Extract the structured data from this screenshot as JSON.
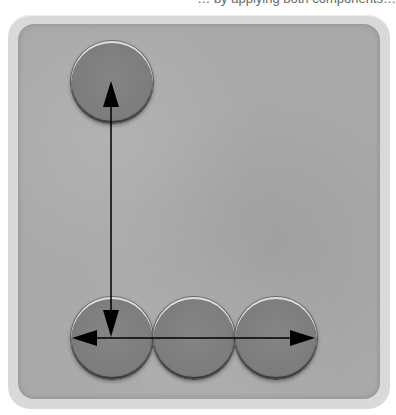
{
  "caption": {
    "text": "… by applying both components…",
    "note": "clipped at top edge; only descenders visible"
  },
  "diagram": {
    "title": "",
    "colors": {
      "page_background": "#ffffff",
      "frame": "#d9d9d9",
      "panel": "#a9a9a9",
      "disc": "#7d7d7d",
      "arrow": "#000000"
    },
    "discs": [
      {
        "id": "top-left",
        "label": ""
      },
      {
        "id": "bottom-left",
        "label": ""
      },
      {
        "id": "bottom-middle",
        "label": ""
      },
      {
        "id": "bottom-right",
        "label": ""
      }
    ],
    "arrows": [
      {
        "id": "vertical",
        "description": "double-headed arrow between top-left disc center and bottom-left disc center"
      },
      {
        "id": "horizontal",
        "description": "double-headed arrow spanning bottom row of discs, left to right"
      }
    ]
  }
}
